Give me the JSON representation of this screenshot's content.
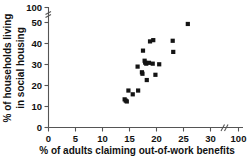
{
  "chart_data": {
    "type": "scatter",
    "title": "",
    "xlabel": "% of adults claiming out-of-work benefits",
    "ylabel": "% of households living in social housing",
    "xlim": [
      0,
      100
    ],
    "ylim": [
      0,
      100
    ],
    "grid": false,
    "legend": null,
    "axis_break": {
      "x_break_between": [
        30,
        100
      ],
      "y_break_between": [
        50,
        100
      ]
    },
    "xticks": [
      0,
      5,
      10,
      15,
      20,
      25,
      30,
      100
    ],
    "xtick_labels": [
      "0",
      "5",
      "10",
      "15",
      "20",
      "25",
      "30",
      "100"
    ],
    "yticks": [
      0,
      10,
      20,
      30,
      40,
      50,
      100
    ],
    "ytick_labels": [
      "0",
      "10",
      "20",
      "30",
      "40",
      "50",
      "100"
    ],
    "marker": "square",
    "marker_color": "#141414",
    "points": [
      {
        "x": 14.1,
        "y": 13.4
      },
      {
        "x": 14.3,
        "y": 12.8
      },
      {
        "x": 14.5,
        "y": 12.4
      },
      {
        "x": 14.8,
        "y": 17.6
      },
      {
        "x": 15.6,
        "y": 15.8
      },
      {
        "x": 16.6,
        "y": 17.6
      },
      {
        "x": 16.5,
        "y": 29.0
      },
      {
        "x": 17.3,
        "y": 26.3
      },
      {
        "x": 17.4,
        "y": 25.6
      },
      {
        "x": 17.5,
        "y": 36.6
      },
      {
        "x": 17.8,
        "y": 31.8
      },
      {
        "x": 17.9,
        "y": 30.9
      },
      {
        "x": 18.1,
        "y": 30.4
      },
      {
        "x": 18.2,
        "y": 22.6
      },
      {
        "x": 18.6,
        "y": 30.8
      },
      {
        "x": 18.8,
        "y": 41.0
      },
      {
        "x": 19.3,
        "y": 30.4
      },
      {
        "x": 19.4,
        "y": 41.6
      },
      {
        "x": 19.8,
        "y": 25.1
      },
      {
        "x": 20.5,
        "y": 30.1
      },
      {
        "x": 23.0,
        "y": 41.3
      },
      {
        "x": 23.1,
        "y": 36.0
      },
      {
        "x": 25.8,
        "y": 49.3
      }
    ]
  }
}
